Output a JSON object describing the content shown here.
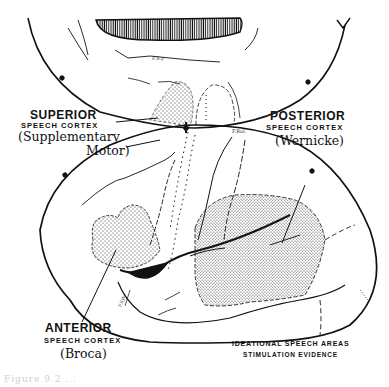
{
  "figure": {
    "type": "brain-cortex-diagram",
    "labels": {
      "superior": {
        "title": "SUPERIOR",
        "subtitle": "SPEECH CORTEX",
        "note_line1": "(Supplementary",
        "note_line2": "Motor)"
      },
      "posterior": {
        "title": "POSTERIOR",
        "subtitle": "SPEECH CORTEX",
        "note": "(Wernicke)"
      },
      "anterior": {
        "title": "ANTERIOR",
        "subtitle": "SPEECH CORTEX",
        "note": "(Broca)"
      },
      "legend_line1": "IDEATIONAL SPEECH AREAS",
      "legend_line2": "STIMULATION EVIDENCE"
    },
    "small_annotations": {
      "top_fissure": "F.S.y",
      "rolandic": "F.Rol.",
      "sylvian": "F.Sylv."
    },
    "caption": "Figure 9.2 ..."
  }
}
